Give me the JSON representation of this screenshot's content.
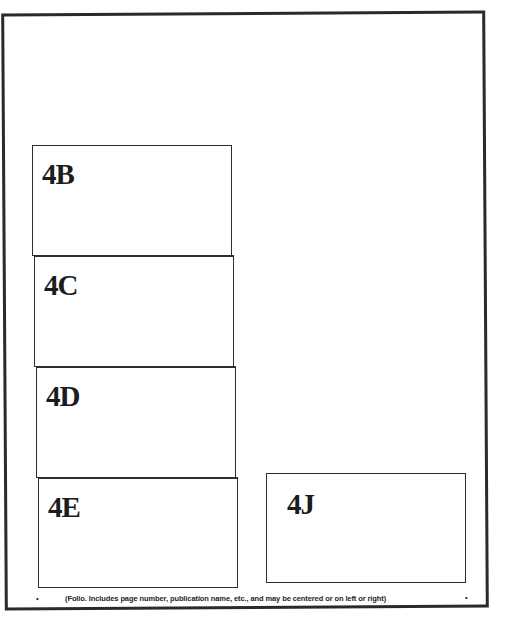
{
  "regions": [
    {
      "id": "4B",
      "label": "4B"
    },
    {
      "id": "4C",
      "label": "4C"
    },
    {
      "id": "4D",
      "label": "4D"
    },
    {
      "id": "4E",
      "label": "4E"
    },
    {
      "id": "4J",
      "label": "4J"
    }
  ],
  "folio": {
    "bullet_left": "•",
    "text": "(Folio. Includes page number, publication name, etc., and may be centered or on left or right)",
    "bullet_right": "•"
  },
  "colors": {
    "frame": "#2a2a2a",
    "region_border": "#2e2e2e",
    "label": "#1c1c1c",
    "background": "#ffffff"
  }
}
